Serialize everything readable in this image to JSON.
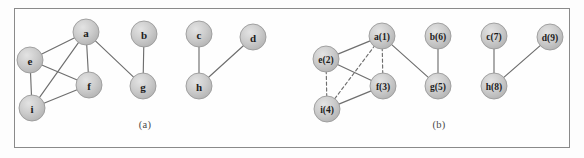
{
  "figure": {
    "background_color": "#fdfdfd",
    "frame_color": "#8a8a8a",
    "node_fill": "#c9c9c9",
    "node_stroke": "#9a9a9a",
    "edge_color": "#6e6e6e",
    "label_color": "#1c1c1c",
    "node_radius": 13
  },
  "panels": [
    {
      "id": "panel-a",
      "caption": "(a)",
      "caption_x": 145,
      "caption_y": 124,
      "nodes": [
        {
          "id": "a",
          "label": "a",
          "x": 86,
          "y": 32,
          "font_size": 11
        },
        {
          "id": "b",
          "label": "b",
          "x": 144,
          "y": 34,
          "font_size": 11
        },
        {
          "id": "c",
          "label": "c",
          "x": 199,
          "y": 34,
          "font_size": 11
        },
        {
          "id": "d",
          "label": "d",
          "x": 253,
          "y": 37,
          "font_size": 11
        },
        {
          "id": "e",
          "label": "e",
          "x": 30,
          "y": 60,
          "font_size": 11
        },
        {
          "id": "f",
          "label": "f",
          "x": 89,
          "y": 85,
          "font_size": 11
        },
        {
          "id": "g",
          "label": "g",
          "x": 143,
          "y": 86,
          "font_size": 11
        },
        {
          "id": "h",
          "label": "h",
          "x": 199,
          "y": 86,
          "font_size": 11
        },
        {
          "id": "i",
          "label": "i",
          "x": 32,
          "y": 108,
          "font_size": 11
        }
      ],
      "edges": [
        {
          "from": "a",
          "to": "e",
          "style": "solid"
        },
        {
          "from": "a",
          "to": "f",
          "style": "solid"
        },
        {
          "from": "a",
          "to": "i",
          "style": "solid"
        },
        {
          "from": "a",
          "to": "g",
          "style": "solid"
        },
        {
          "from": "e",
          "to": "f",
          "style": "solid"
        },
        {
          "from": "e",
          "to": "i",
          "style": "solid"
        },
        {
          "from": "i",
          "to": "f",
          "style": "solid"
        },
        {
          "from": "b",
          "to": "g",
          "style": "solid"
        },
        {
          "from": "c",
          "to": "h",
          "style": "solid"
        },
        {
          "from": "d",
          "to": "h",
          "style": "solid"
        }
      ]
    },
    {
      "id": "panel-b",
      "caption": "(b)",
      "caption_x": 439,
      "caption_y": 124,
      "nodes": [
        {
          "id": "a",
          "label": "a(1)",
          "x": 382,
          "y": 36,
          "font_size": 9.5
        },
        {
          "id": "e",
          "label": "e(2)",
          "x": 326,
          "y": 59,
          "font_size": 9.5
        },
        {
          "id": "f",
          "label": "f(3)",
          "x": 383,
          "y": 86,
          "font_size": 9.5
        },
        {
          "id": "i",
          "label": "i(4)",
          "x": 327,
          "y": 109,
          "font_size": 9.5
        },
        {
          "id": "g",
          "label": "g(5)",
          "x": 438,
          "y": 86,
          "font_size": 9.5
        },
        {
          "id": "b",
          "label": "b(6)",
          "x": 438,
          "y": 36,
          "font_size": 9.5
        },
        {
          "id": "c",
          "label": "c(7)",
          "x": 494,
          "y": 36,
          "font_size": 9.5
        },
        {
          "id": "h",
          "label": "h(8)",
          "x": 494,
          "y": 86,
          "font_size": 9.5
        },
        {
          "id": "d",
          "label": "d(9)",
          "x": 550,
          "y": 37,
          "font_size": 9.5
        }
      ],
      "edges": [
        {
          "from": "a",
          "to": "e",
          "style": "solid"
        },
        {
          "from": "a",
          "to": "g",
          "style": "solid"
        },
        {
          "from": "e",
          "to": "f",
          "style": "solid"
        },
        {
          "from": "i",
          "to": "f",
          "style": "solid"
        },
        {
          "from": "a",
          "to": "f",
          "style": "dashed"
        },
        {
          "from": "a",
          "to": "i",
          "style": "dashed"
        },
        {
          "from": "e",
          "to": "i",
          "style": "dashed"
        },
        {
          "from": "b",
          "to": "g",
          "style": "solid"
        },
        {
          "from": "c",
          "to": "h",
          "style": "solid"
        },
        {
          "from": "d",
          "to": "h",
          "style": "solid"
        }
      ]
    }
  ]
}
